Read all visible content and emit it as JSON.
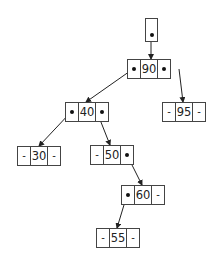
{
  "diagram": {
    "type": "binary-search-tree",
    "root_pointer": {
      "label": "root",
      "has_pointer": true
    },
    "nodes": [
      {
        "id": "n90",
        "key": "90",
        "left": "n40",
        "right": "n95"
      },
      {
        "id": "n40",
        "key": "40",
        "left": "n30",
        "right": "n50"
      },
      {
        "id": "n95",
        "key": "95",
        "left": "-",
        "right": "-"
      },
      {
        "id": "n30",
        "key": "30",
        "left": "-",
        "right": "-"
      },
      {
        "id": "n50",
        "key": "50",
        "left": "-",
        "right": "n60"
      },
      {
        "id": "n60",
        "key": "60",
        "left": "n55",
        "right": "-"
      },
      {
        "id": "n55",
        "key": "55",
        "left": "-",
        "right": "-"
      }
    ],
    "null_symbol": "-",
    "colors": {
      "stroke": "#444444",
      "pointer": "#111111",
      "background": "#ffffff"
    }
  }
}
